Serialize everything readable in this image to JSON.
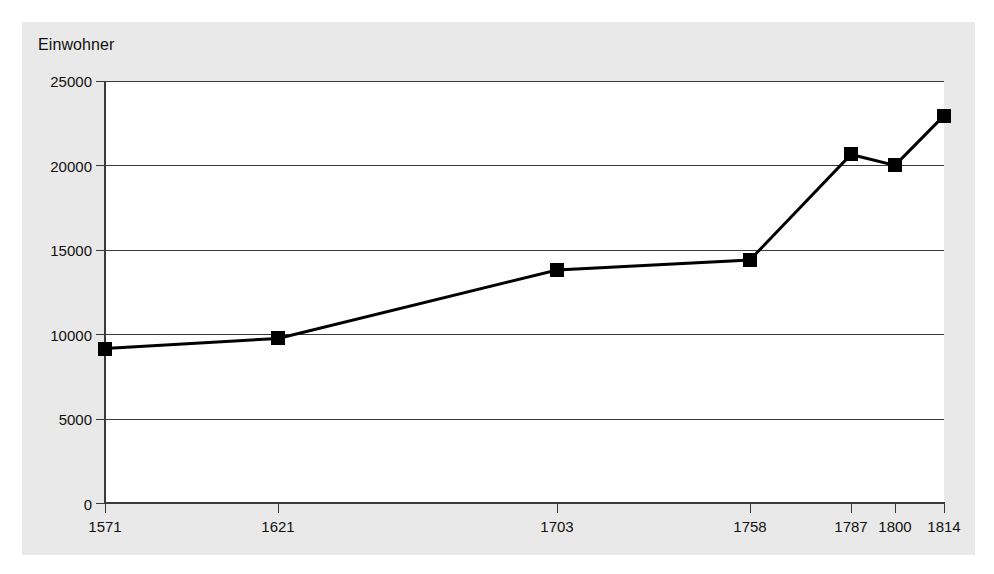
{
  "chart_data": {
    "type": "line",
    "title": "",
    "ylabel": "Einwohner",
    "xlabel": "",
    "categories": [
      "1571",
      "1621",
      "1703",
      "1758",
      "1787",
      "1800",
      "1814"
    ],
    "values": [
      9150,
      9750,
      13800,
      14400,
      20650,
      20000,
      22950
    ],
    "series": [
      {
        "name": "Einwohner",
        "values": [
          9150,
          9750,
          13800,
          14400,
          20650,
          20000,
          22950
        ]
      }
    ],
    "ylim": [
      0,
      25000
    ],
    "yticks": [
      "0",
      "5000",
      "10000",
      "15000",
      "20000",
      "25000"
    ],
    "grid": true,
    "legend": "none",
    "marker": "square",
    "line_color": "#000000",
    "marker_color": "#000000",
    "plot_background": "#ffffff",
    "panel_background": "#e9e9e9"
  },
  "axis": {
    "y_title": "Einwohner",
    "y_tick_labels": [
      "25000",
      "20000",
      "15000",
      "10000",
      "5000",
      "0"
    ],
    "x_tick_labels": [
      "1571",
      "1621",
      "1703",
      "1758",
      "1787",
      "1800",
      "1814"
    ]
  }
}
